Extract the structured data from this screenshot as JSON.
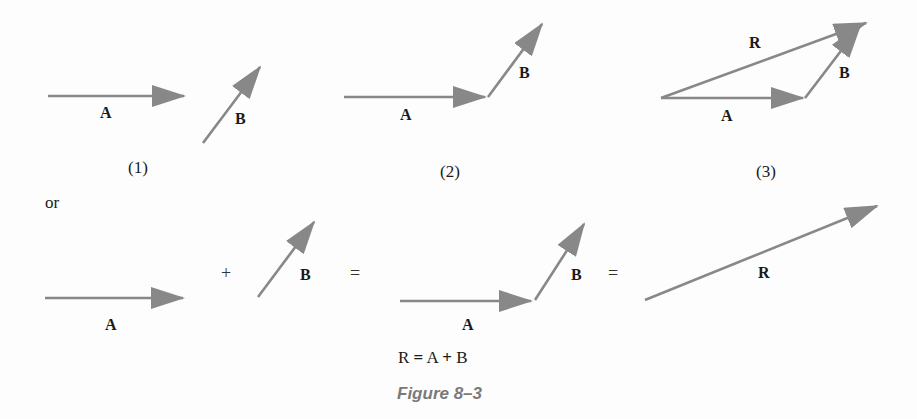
{
  "colors": {
    "vector": "#888888",
    "text": "#1a1a1a",
    "caption": "#7a7a7a"
  },
  "panels": [
    {
      "id": "1",
      "caption": "(1)",
      "labels": {
        "a": "A",
        "b": "B"
      }
    },
    {
      "id": "2",
      "caption": "(2)",
      "labels": {
        "a": "A",
        "b": "B"
      }
    },
    {
      "id": "3",
      "caption": "(3)",
      "labels": {
        "a": "A",
        "b": "B",
        "r": "R"
      }
    }
  ],
  "connector": "or",
  "equation_row": {
    "labels": {
      "a1": "A",
      "b1": "B",
      "a2": "A",
      "b2": "B",
      "r": "R"
    },
    "plus": "+",
    "equals1": "=",
    "equals2": "="
  },
  "formula": {
    "r": "R",
    "eq": "=",
    "a": "A",
    "plus": "+",
    "b": "B"
  },
  "figure_caption": "Figure 8–3"
}
